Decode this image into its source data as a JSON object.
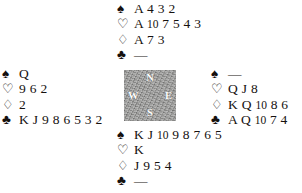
{
  "diagram": {
    "type": "bridge-deal",
    "suit_symbols": {
      "spades": "♠",
      "hearts": "♡",
      "diamonds": "♢",
      "clubs": "♣"
    },
    "void_marker": "—",
    "compass": {
      "north": "N",
      "west": "W",
      "east": "E",
      "south": "S",
      "background_color": "#9a9a98",
      "label_color": "#fdfdfd"
    },
    "text_color": "#15110f",
    "background_color": "#ffffff"
  },
  "hands": {
    "north": {
      "position_label": "North",
      "spades": "A 4 3 2",
      "hearts": "A 10 7 5 4 3",
      "diamonds": "A 7 3",
      "clubs": "—"
    },
    "west": {
      "position_label": "West",
      "spades": "Q",
      "hearts": "9 6 2",
      "diamonds": "2",
      "clubs": "K J 9 8 6 5 3 2"
    },
    "east": {
      "position_label": "East",
      "spades": "—",
      "hearts": "Q J 8",
      "diamonds": "K Q 10 8 6",
      "clubs": "A Q 10 7 4"
    },
    "south": {
      "position_label": "South",
      "spades": "K J 10 9 8 7 6 5",
      "hearts": "K",
      "diamonds": "J 9 5 4",
      "clubs": "—"
    }
  }
}
